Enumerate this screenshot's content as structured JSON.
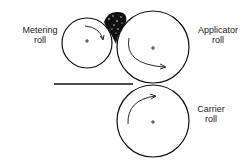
{
  "diagram": {
    "labels": {
      "metering": [
        "Metering",
        "roll"
      ],
      "applicator": [
        "Applicator",
        "roll"
      ],
      "carrier": [
        "Carrier",
        "roll"
      ]
    },
    "rolls": [
      {
        "name": "Metering roll",
        "cx": 87,
        "cy": 43,
        "r": 25,
        "rotation": "clockwise"
      },
      {
        "name": "Applicator roll",
        "cx": 153,
        "cy": 47,
        "r": 36,
        "rotation": "counterclockwise"
      },
      {
        "name": "Carrier roll",
        "cx": 153,
        "cy": 121,
        "r": 36,
        "rotation": "clockwise"
      }
    ],
    "web_line": {
      "x1": 54,
      "y1": 84,
      "x2": 133,
      "y2": 84
    },
    "colors": {
      "stroke": "#111111",
      "coating": "#111111"
    }
  }
}
